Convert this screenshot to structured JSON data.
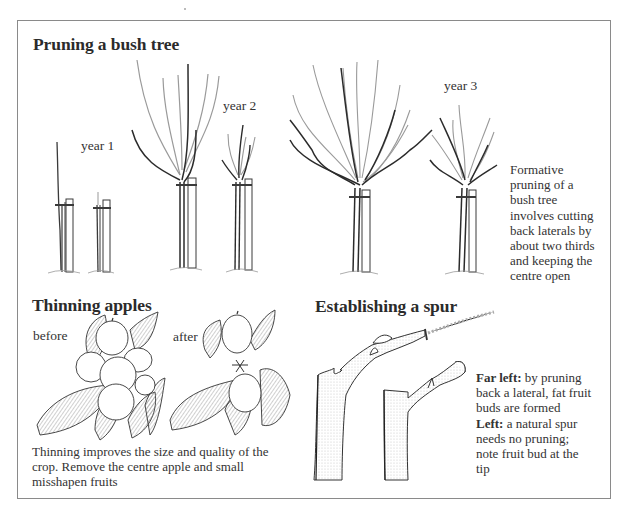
{
  "sections": {
    "pruning": {
      "title": "Pruning a bush tree",
      "labels": [
        "year 1",
        "year 2",
        "year 3"
      ],
      "caption_lines": [
        "Formative",
        "pruning of a",
        "bush tree",
        "involves cutting",
        "back laterals by",
        "about two thirds",
        "and keeping the",
        "centre open"
      ]
    },
    "thinning": {
      "title": "Thinning apples",
      "labels": [
        "before",
        "after"
      ],
      "caption_lines": [
        "Thinning improves the size and quality of the",
        "crop. Remove the centre apple and small",
        "misshapen fruits"
      ]
    },
    "spur": {
      "title": "Establishing a spur",
      "caption": {
        "far_left_label": "Far left:",
        "far_left_text_1": " by pruning",
        "far_left_text_2": "back a lateral, fat fruit",
        "far_left_text_3": "buds are formed",
        "left_label": "Left:",
        "left_text_1": " a natural spur",
        "left_text_2": "needs no pruning;",
        "left_text_3": "note fruit bud at the",
        "left_text_4": "tip"
      }
    }
  },
  "illustrations": [
    {
      "name": "year-1-tree-unpruned"
    },
    {
      "name": "year-1-tree-pruned"
    },
    {
      "name": "year-2-tree-unpruned"
    },
    {
      "name": "year-2-tree-pruned"
    },
    {
      "name": "year-3-tree-unpruned"
    },
    {
      "name": "year-3-tree-pruned"
    },
    {
      "name": "apple-cluster-before"
    },
    {
      "name": "apple-cluster-after"
    },
    {
      "name": "spur-pruned-lateral"
    },
    {
      "name": "spur-natural"
    }
  ],
  "colors": {
    "ink": "#2b2b2b",
    "pruned_growth": "#a8a8a8",
    "frame": "#8a8a8a"
  }
}
